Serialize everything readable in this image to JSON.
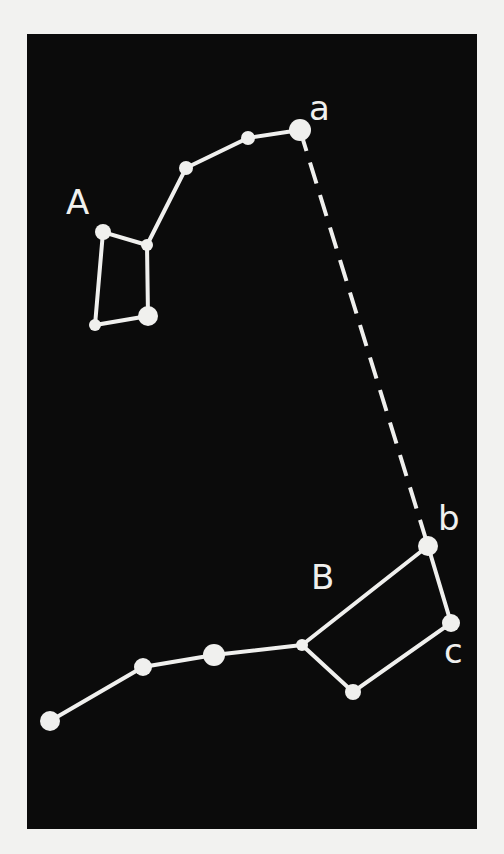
{
  "figure": {
    "type": "star-constellation-diagram",
    "background_color": "#0b0b0b",
    "line_color": "#f0f0ee",
    "page_color": "#f2f2f0"
  },
  "labels": {
    "constellation_A": "A",
    "constellation_B": "B",
    "star_a": "a",
    "star_b": "b",
    "star_c": "c"
  },
  "constellations": [
    {
      "name": "A",
      "stars": [
        {
          "id": "a",
          "x": 300,
          "y": 130,
          "r": 11
        },
        {
          "id": "A2",
          "x": 248,
          "y": 138,
          "r": 7
        },
        {
          "id": "A3",
          "x": 186,
          "y": 168,
          "r": 7
        },
        {
          "id": "A4",
          "x": 147,
          "y": 245,
          "r": 6
        },
        {
          "id": "A5",
          "x": 103,
          "y": 232,
          "r": 8
        },
        {
          "id": "A6",
          "x": 95,
          "y": 325,
          "r": 6
        },
        {
          "id": "A7",
          "x": 148,
          "y": 316,
          "r": 10
        }
      ]
    },
    {
      "name": "B",
      "stars": [
        {
          "id": "b",
          "x": 428,
          "y": 546,
          "r": 10
        },
        {
          "id": "c",
          "x": 451,
          "y": 623,
          "r": 9
        },
        {
          "id": "B3",
          "x": 353,
          "y": 692,
          "r": 8
        },
        {
          "id": "B4",
          "x": 302,
          "y": 645,
          "r": 6
        },
        {
          "id": "B5",
          "x": 214,
          "y": 655,
          "r": 11
        },
        {
          "id": "B6",
          "x": 143,
          "y": 667,
          "r": 9
        },
        {
          "id": "B7",
          "x": 50,
          "y": 721,
          "r": 10
        }
      ]
    }
  ],
  "connector": {
    "from": "a",
    "to": "b",
    "style": "dashed"
  }
}
